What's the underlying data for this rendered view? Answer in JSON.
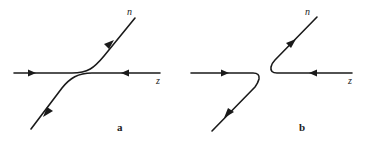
{
  "diagram": {
    "type": "particle-trajectory-comparison",
    "panels": [
      {
        "id": "a",
        "label": "a",
        "particle_labels": {
          "outgoing": "n",
          "incoming": "z"
        },
        "description": "Two incoming horizontal lines deflect smoothly: one curves up-right toward n, the other curves down-left"
      },
      {
        "id": "b",
        "label": "b",
        "particle_labels": {
          "outgoing": "n",
          "incoming": "z"
        },
        "description": "Two incoming horizontal lines make sharp turns: left line turns down-left, right line turns up-right toward n"
      }
    ],
    "colors": {
      "stroke": "#1a1a1a",
      "background": "#ffffff"
    }
  }
}
